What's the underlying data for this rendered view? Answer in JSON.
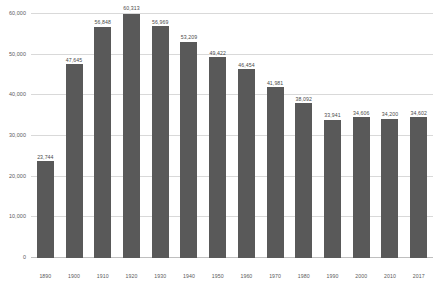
{
  "chart_data": {
    "type": "bar",
    "title": "",
    "xlabel": "",
    "ylabel": "",
    "categories": [
      "1890",
      "1900",
      "1910",
      "1920",
      "1930",
      "1940",
      "1950",
      "1960",
      "1970",
      "1980",
      "1990",
      "2000",
      "2010",
      "2017"
    ],
    "values": [
      23744,
      47645,
      56848,
      60313,
      56969,
      53209,
      49422,
      46454,
      41981,
      38092,
      33941,
      34606,
      34200,
      34602
    ],
    "value_labels": [
      "23,744",
      "47,645",
      "56,848",
      "60,313",
      "56,969",
      "53,209",
      "49,422",
      "46,454",
      "41,981",
      "38,092",
      "33,941",
      "34,606",
      "34,200",
      "34,602"
    ],
    "ylim": [
      0,
      60000
    ],
    "yticks": [
      0,
      10000,
      20000,
      30000,
      40000,
      50000,
      60000
    ],
    "ytick_labels": [
      "0",
      "10,000",
      "20,000",
      "30,000",
      "40,000",
      "50,000",
      "60,000"
    ],
    "grid": true,
    "legend": false,
    "bar_color": "#595959",
    "grid_color": "#d9d9d9",
    "background_color": "#ffffff"
  }
}
